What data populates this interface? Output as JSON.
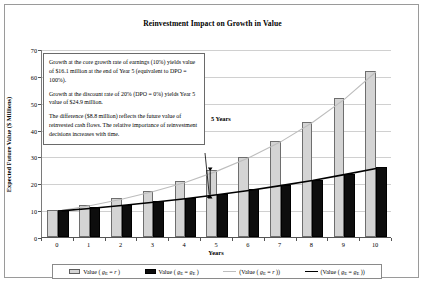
{
  "frame": {
    "name": "chart-figure"
  },
  "chart_data": {
    "type": "bar",
    "title": "Reinvestment Impact on Growth in Value",
    "xlabel": "Years",
    "ylabel": "Expected Future Value ($ Millions)",
    "categories": [
      "0",
      "1",
      "2",
      "3",
      "4",
      "5",
      "6",
      "7",
      "8",
      "9",
      "10"
    ],
    "x": [
      0,
      1,
      2,
      3,
      4,
      5,
      6,
      7,
      8,
      9,
      10
    ],
    "ylim": [
      0,
      70
    ],
    "yticks": [
      0,
      10,
      20,
      30,
      40,
      50,
      60,
      70
    ],
    "grid": true,
    "legend_position": "bottom",
    "series": [
      {
        "name": "Value ( g_E = r )",
        "kind": "bar",
        "color": "#d4d4d4",
        "values": [
          10.0,
          12.0,
          14.4,
          17.3,
          20.7,
          24.9,
          29.9,
          35.8,
          43.0,
          51.6,
          61.9
        ]
      },
      {
        "name": "Value ( g_E = g_E )",
        "kind": "bar",
        "color": "#0d0d0d",
        "values": [
          10.0,
          11.0,
          12.1,
          13.3,
          14.6,
          16.1,
          17.7,
          19.5,
          21.4,
          23.6,
          25.9
        ]
      },
      {
        "name": "(Value ( g_E = r ))",
        "kind": "line",
        "color": "#bdbdbd",
        "values": [
          10.0,
          12.0,
          14.4,
          17.3,
          20.7,
          24.9,
          29.9,
          35.8,
          43.0,
          51.6,
          61.9
        ]
      },
      {
        "name": "(Value ( g_E = g_E ))",
        "kind": "line",
        "color": "#000000",
        "values": [
          10.0,
          11.0,
          12.1,
          13.3,
          14.6,
          16.1,
          17.7,
          19.5,
          21.4,
          23.6,
          25.9
        ]
      }
    ],
    "annotations": [
      {
        "text": "5 Years",
        "x": 5,
        "note": "vertical double-headed arrow spanning the gap between the two series at Year 5"
      }
    ]
  },
  "callout": {
    "paragraph1": "Growth at the core growth rate of earnings (10%) yields value of $16.1 million at the end of Year 5 (equivalent to DPO = 100%).",
    "paragraph2": "Growth at the discount rate of 20% (DPO = 0%) yields Year 5 value of $24.9 million.",
    "paragraph3": "The difference ($8.8 million) reflects the future value of reinvested cash flows. The relative importance of reinvestment decisions increases with time."
  },
  "annotation": {
    "five_years": "5 Years"
  },
  "legend": {
    "items": [
      {
        "marker": "gray-box",
        "prefix": "Value (",
        "sub_main": "g",
        "sub_small": "E",
        "eq": " = ",
        "rhs_main": "r",
        "rhs_small": "",
        "suffix": ")"
      },
      {
        "marker": "black-box",
        "prefix": "Value (",
        "sub_main": "g",
        "sub_small": "E",
        "eq": " = ",
        "rhs_main": "g",
        "rhs_small": "E",
        "suffix": ")"
      },
      {
        "marker": "gray-line",
        "prefix": "(Value (",
        "sub_main": "g",
        "sub_small": "E",
        "eq": " = ",
        "rhs_main": "r",
        "rhs_small": "",
        "suffix": "))"
      },
      {
        "marker": "black-line",
        "prefix": "(Value (",
        "sub_main": "g",
        "sub_small": "E",
        "eq": " = ",
        "rhs_main": "g",
        "rhs_small": "E",
        "suffix": "))"
      }
    ]
  },
  "colors": {
    "bar_gray": "#d4d4d4",
    "bar_black": "#0d0d0d",
    "line_gray": "#bdbdbd",
    "line_black": "#000000",
    "grid": "#d0d0d0",
    "frame": "#9a9a9a"
  }
}
